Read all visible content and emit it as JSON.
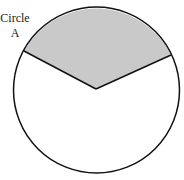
{
  "label": {
    "line1": "Circle",
    "line2": "A"
  },
  "diagram": {
    "shape": "circle",
    "shaded_sector": "upper sector bounded by two radii",
    "colors": {
      "outline": "#111111",
      "shaded_fill": "#c9c9c9",
      "background": "#ffffff"
    }
  }
}
